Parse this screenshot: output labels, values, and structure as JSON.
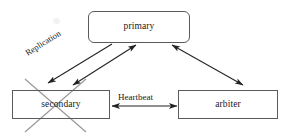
{
  "diagram": {
    "background_color": "#ffffff",
    "box_border_color": "#5a5a5a",
    "arrow_color": "#222222",
    "strikeout_color": "#9a9a9a",
    "nodes": [
      {
        "id": "primary",
        "label": "primary",
        "shape": "rounded-rectangle",
        "struck_out": false
      },
      {
        "id": "secondary",
        "label": "secondary",
        "shape": "rectangle",
        "struck_out": true
      },
      {
        "id": "arbiter",
        "label": "arbiter",
        "shape": "rectangle",
        "struck_out": false
      }
    ],
    "edges": [
      {
        "id": "replication",
        "label": "Replication",
        "from": "primary",
        "to": "secondary",
        "arrowheads": "end",
        "label_rotated": true
      },
      {
        "id": "primary-secondary",
        "label": "",
        "from": "primary",
        "to": "secondary",
        "arrowheads": "both",
        "label_rotated": false
      },
      {
        "id": "primary-arbiter",
        "label": "",
        "from": "primary",
        "to": "arbiter",
        "arrowheads": "both",
        "label_rotated": false
      },
      {
        "id": "heartbeat",
        "label": "Heartbeat",
        "from": "secondary",
        "to": "arbiter",
        "arrowheads": "both",
        "label_rotated": false
      }
    ],
    "annotations": [
      {
        "id": "secondary-strikeout",
        "type": "x-cross",
        "target": "secondary"
      }
    ]
  }
}
